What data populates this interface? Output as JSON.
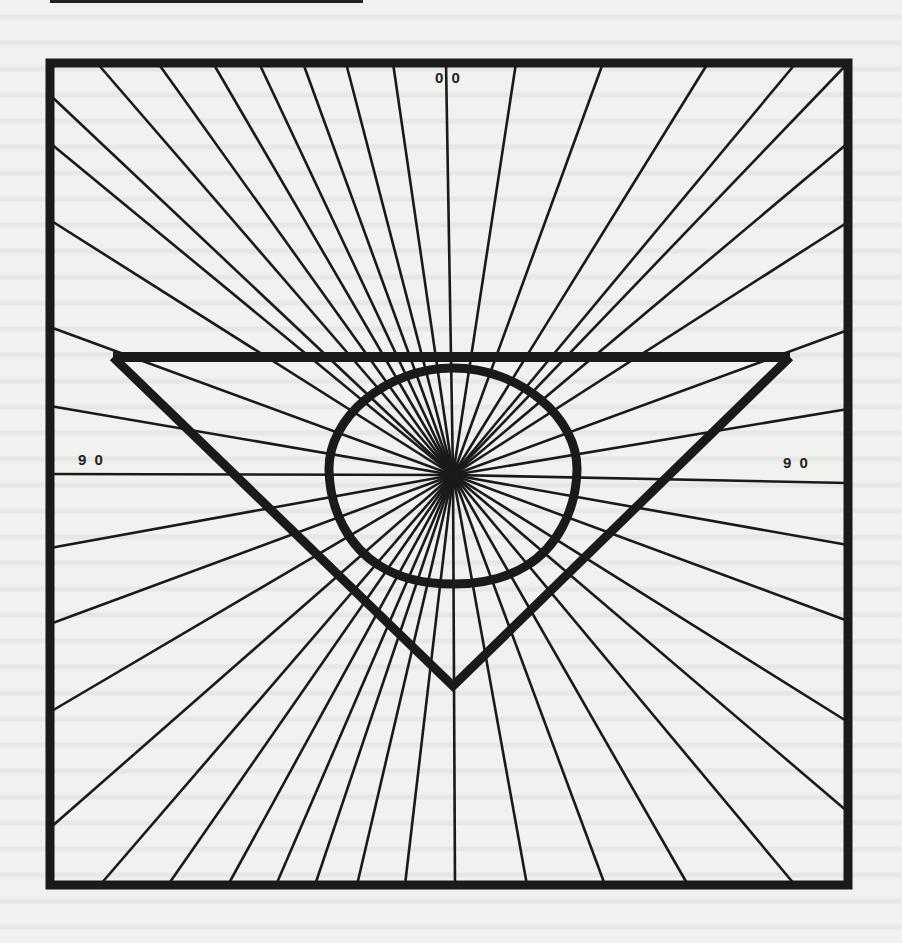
{
  "figure": {
    "labels": {
      "top": "0 0",
      "left": "9 0",
      "right": "9 0"
    },
    "colors": {
      "ink": "#1a1a1a",
      "paper": "#f1f1f0"
    },
    "center": [
      453,
      475
    ],
    "frame": {
      "x1": 50,
      "y1": 63,
      "x2": 848,
      "y2": 885
    },
    "bar": {
      "x1": 113,
      "x2": 790,
      "y": 357
    },
    "triangle": {
      "left": [
        113,
        357
      ],
      "right": [
        790,
        357
      ],
      "apex": [
        453,
        686
      ]
    },
    "rays": {
      "top": [
        [
          97,
          63
        ],
        [
          158,
          63
        ],
        [
          213,
          63
        ],
        [
          259,
          63
        ],
        [
          303,
          63
        ],
        [
          346,
          63
        ],
        [
          393,
          63
        ],
        [
          446,
          63
        ],
        [
          516,
          63
        ],
        [
          603,
          63
        ],
        [
          708,
          63
        ],
        [
          796,
          63
        ],
        [
          848,
          63
        ]
      ],
      "left": [
        [
          50,
          95
        ],
        [
          50,
          143
        ],
        [
          50,
          220
        ],
        [
          50,
          327
        ],
        [
          50,
          406
        ],
        [
          50,
          474
        ],
        [
          50,
          548
        ],
        [
          50,
          624
        ],
        [
          50,
          712
        ],
        [
          50,
          828
        ]
      ],
      "right": [
        [
          848,
          143
        ],
        [
          848,
          222
        ],
        [
          848,
          330
        ],
        [
          848,
          409
        ],
        [
          848,
          483
        ],
        [
          848,
          545
        ],
        [
          848,
          621
        ],
        [
          848,
          722
        ],
        [
          848,
          812
        ]
      ],
      "bottom": [
        [
          100,
          885
        ],
        [
          168,
          885
        ],
        [
          228,
          885
        ],
        [
          276,
          885
        ],
        [
          315,
          885
        ],
        [
          357,
          885
        ],
        [
          405,
          885
        ],
        [
          455,
          885
        ],
        [
          527,
          885
        ],
        [
          605,
          885
        ],
        [
          688,
          885
        ],
        [
          795,
          885
        ]
      ]
    }
  }
}
